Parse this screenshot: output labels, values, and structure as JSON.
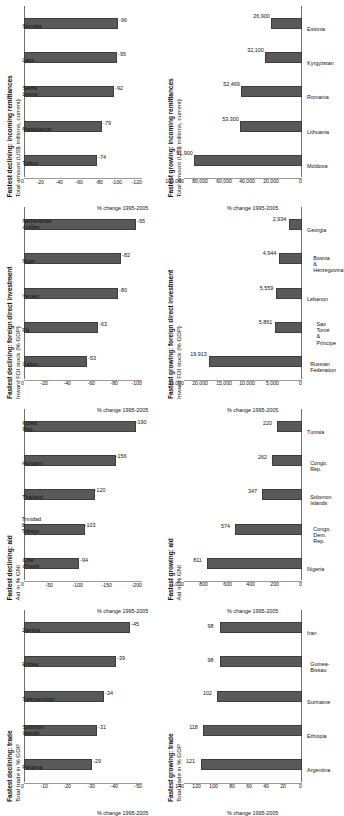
{
  "figure": {
    "bar_color": "#595959",
    "background": "#ffffff",
    "axis_color": "#9a9a9a"
  },
  "chart_data": [
    {
      "id": "declining-trade",
      "type": "bar",
      "title": "Fastest declining: trade",
      "subtitle": "Total trade in % GDP",
      "xlabel": "",
      "ylabel": "% change 1995-2005",
      "categories": [
        "Panama",
        "Solomon Islands",
        "Turkmenistan",
        "Eritrea",
        "Zambia"
      ],
      "values": [
        -29,
        -31,
        -34,
        -39,
        -45
      ],
      "ticks": [
        "0",
        "-10",
        "-20",
        "-30",
        "-40",
        "-50"
      ],
      "ylim": [
        -50,
        0
      ],
      "grid": false,
      "legend": "none"
    },
    {
      "id": "declining-aid",
      "type": "bar",
      "title": "Fastest declining: aid",
      "subtitle": "Aid in % GNI",
      "xlabel": "",
      "ylabel": "% change 1995-2005",
      "categories": [
        "Côte d'Ivoire",
        "Trinidad &\nTobago",
        "Thailand",
        "Hungary",
        "Korea, Rep."
      ],
      "values": [
        -94,
        -103,
        -120,
        -156,
        -190
      ],
      "ticks": [
        "0",
        "-50",
        "-100",
        "-150",
        "-200"
      ],
      "ylim": [
        -200,
        0
      ],
      "grid": false,
      "legend": "none"
    },
    {
      "id": "declining-fdi",
      "type": "bar",
      "title": "Fastest declining: foreign direct investment",
      "subtitle": "Inward FDI stock (% GDP)",
      "xlabel": "",
      "ylabel": "% change 1995-2005",
      "categories": [
        "Gabon",
        "Fiji",
        "Yemen",
        "Niger",
        "Netherlands\nAntilles"
      ],
      "values": [
        -53,
        -63,
        -80,
        -82,
        -95
      ],
      "ticks": [
        "0",
        "-20",
        "-40",
        "-60",
        "-80",
        "-100"
      ],
      "ylim": [
        -100,
        0
      ],
      "grid": false,
      "legend": "none"
    },
    {
      "id": "declining-remittances",
      "type": "bar",
      "title": "Fastest declining: incoming remittances",
      "subtitle": "Total amount (US$ millions, current)",
      "xlabel": "",
      "ylabel": "% change 1995-2005",
      "categories": [
        "Turkey",
        "Madagascar",
        "Sierra Leone",
        "Laos",
        "Somalia"
      ],
      "values": [
        -74,
        -79,
        -92,
        -95,
        -96
      ],
      "ticks": [
        "0",
        "-20",
        "-40",
        "-60",
        "-80",
        "-100",
        "-120"
      ],
      "ylim": [
        -120,
        0
      ],
      "grid": false,
      "legend": "none"
    },
    {
      "id": "growing-trade",
      "type": "bar",
      "title": "Fastest growing: trade",
      "subtitle": "Total trade in % GDP",
      "xlabel": "",
      "ylabel": "% change 1995-2005",
      "categories": [
        "Argentina",
        "Ethiopia",
        "Suriname",
        "Guinea-Bissau",
        "Iran"
      ],
      "values": [
        121,
        118,
        102,
        98,
        98
      ],
      "ticks": [
        "0",
        "20",
        "40",
        "60",
        "80",
        "100",
        "120",
        "140"
      ],
      "ylim": [
        0,
        140
      ],
      "grid": false,
      "legend": "none"
    },
    {
      "id": "growing-aid",
      "type": "bar",
      "title": "Fastest growing: aid",
      "subtitle": "Aid in % GNI",
      "xlabel": "",
      "ylabel": "% change 1995-2005",
      "categories": [
        "Nigeria",
        "Congo, Dem.\nRep.",
        "Solomon Islands",
        "Congo, Rep.",
        "Tunisia"
      ],
      "values": [
        811,
        574,
        347,
        262,
        220
      ],
      "ticks": [
        "0",
        "200",
        "400",
        "600",
        "800",
        "1,000"
      ],
      "ylim": [
        0,
        1000
      ],
      "grid": false,
      "legend": "none"
    },
    {
      "id": "growing-fdi",
      "type": "bar",
      "title": "Fastest growing: foreign direct investment",
      "subtitle": "Inward FDI stock (% GDP)",
      "xlabel": "",
      "ylabel": "% change 1995-2005",
      "categories": [
        "Russian\nFederation",
        "Sao Tomé &\nPrincipe",
        "Lebanon",
        "Bosnia &\nHerzegovina",
        "Georgia"
      ],
      "values": [
        19913,
        5861,
        5559,
        4944,
        2934
      ],
      "value_labels": [
        "19,913",
        "5,861",
        "5,559",
        "4,944",
        "2,934"
      ],
      "ticks": [
        "0",
        "5,000",
        "10,000",
        "15,000",
        "20,000",
        "25,000"
      ],
      "ylim": [
        0,
        25000
      ],
      "grid": false,
      "legend": "none"
    },
    {
      "id": "growing-remittances",
      "type": "bar",
      "title": "Fastest growing: incoming remittances",
      "subtitle": "Total amount (US$ millions, current)",
      "xlabel": "",
      "ylabel": "% change 1995-2005",
      "categories": [
        "Moldova",
        "Lithuania",
        "Romania",
        "Kyrgyzstan",
        "Estonia"
      ],
      "values": [
        91900,
        53300,
        52469,
        32100,
        26900
      ],
      "value_labels": [
        "91,900",
        "53,300",
        "52,469",
        "32,100",
        "26,900"
      ],
      "ticks": [
        "0",
        "20,000",
        "40,000",
        "60,000",
        "80,000",
        "100,000"
      ],
      "ylim": [
        0,
        100000
      ],
      "grid": false,
      "legend": "none"
    }
  ]
}
